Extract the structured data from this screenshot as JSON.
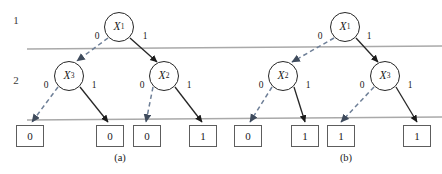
{
  "figure": {
    "levels": [
      {
        "label": "1",
        "x": 9,
        "y": 14
      },
      {
        "label": "2",
        "x": 9,
        "y": 74
      }
    ],
    "separator_color": "#a9a9a9",
    "edge_zero_color": "#6e7f97",
    "edge_one_color": "#262626",
    "node_border_color": "#262626",
    "leaf_border_color": "#5d5d5d",
    "separators": [
      {
        "x1": 27,
        "y1": 49,
        "x2": 442,
        "y2": 46
      },
      {
        "x1": 27,
        "y1": 120,
        "x2": 442,
        "y2": 117
      }
    ],
    "panels": [
      {
        "caption": "(a)",
        "caption_x": 100,
        "caption_y": 152,
        "root": {
          "var": "X",
          "sub": "1",
          "cx": 119,
          "cy": 27
        },
        "internal": [
          {
            "var": "X",
            "sub": "3",
            "cx": 69,
            "cy": 76
          },
          {
            "var": "X",
            "sub": "2",
            "cx": 164,
            "cy": 76
          }
        ],
        "leaves": [
          {
            "value": "0",
            "cx": 30,
            "cy": 136
          },
          {
            "value": "0",
            "cx": 110,
            "cy": 136
          },
          {
            "value": "0",
            "cx": 147,
            "cy": 136
          },
          {
            "value": "1",
            "cx": 203,
            "cy": 136
          }
        ],
        "edge_labels": [
          {
            "text": "0",
            "x": 92,
            "y": 31
          },
          {
            "text": "1",
            "x": 140,
            "y": 31
          },
          {
            "text": "0",
            "x": 41,
            "y": 80
          },
          {
            "text": "1",
            "x": 89,
            "y": 80
          },
          {
            "text": "0",
            "x": 137,
            "y": 80
          },
          {
            "text": "1",
            "x": 184,
            "y": 80
          }
        ],
        "edges": [
          {
            "branch": "0",
            "x1": 108,
            "y1": 38,
            "x2": 77,
            "y2": 61
          },
          {
            "branch": "1",
            "x1": 130,
            "y1": 38,
            "x2": 157,
            "y2": 62
          },
          {
            "branch": "0",
            "x1": 58,
            "y1": 87,
            "x2": 32,
            "y2": 122
          },
          {
            "branch": "1",
            "x1": 80,
            "y1": 87,
            "x2": 108,
            "y2": 122
          },
          {
            "branch": "0",
            "x1": 153,
            "y1": 87,
            "x2": 146,
            "y2": 122
          },
          {
            "branch": "1",
            "x1": 175,
            "y1": 87,
            "x2": 202,
            "y2": 122
          }
        ]
      },
      {
        "caption": "(b)",
        "caption_x": 326,
        "caption_y": 152,
        "root": {
          "var": "X",
          "sub": "1",
          "cx": 345,
          "cy": 27
        },
        "internal": [
          {
            "var": "X",
            "sub": "2",
            "cx": 283,
            "cy": 76
          },
          {
            "var": "X",
            "sub": "3",
            "cx": 385,
            "cy": 76
          }
        ],
        "leaves": [
          {
            "value": "0",
            "cx": 248,
            "cy": 136
          },
          {
            "value": "1",
            "cx": 305,
            "cy": 136
          },
          {
            "value": "1",
            "cx": 341,
            "cy": 136
          },
          {
            "value": "1",
            "cx": 417,
            "cy": 136
          }
        ],
        "edge_labels": [
          {
            "text": "0",
            "x": 315,
            "y": 31
          },
          {
            "text": "1",
            "x": 364,
            "y": 31
          },
          {
            "text": "0",
            "x": 256,
            "y": 80
          },
          {
            "text": "1",
            "x": 303,
            "y": 80
          },
          {
            "text": "0",
            "x": 357,
            "y": 80
          },
          {
            "text": "1",
            "x": 405,
            "y": 80
          }
        ],
        "edges": [
          {
            "branch": "0",
            "x1": 334,
            "y1": 38,
            "x2": 292,
            "y2": 62
          },
          {
            "branch": "1",
            "x1": 356,
            "y1": 38,
            "x2": 378,
            "y2": 62
          },
          {
            "branch": "0",
            "x1": 272,
            "y1": 87,
            "x2": 250,
            "y2": 122
          },
          {
            "branch": "1",
            "x1": 294,
            "y1": 87,
            "x2": 305,
            "y2": 122
          },
          {
            "branch": "0",
            "x1": 374,
            "y1": 87,
            "x2": 341,
            "y2": 122
          },
          {
            "branch": "1",
            "x1": 396,
            "y1": 87,
            "x2": 417,
            "y2": 122
          }
        ]
      }
    ]
  }
}
